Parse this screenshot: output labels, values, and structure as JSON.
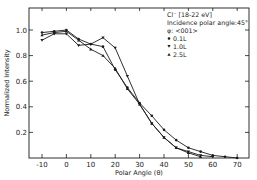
{
  "chart_data": {
    "type": "line",
    "title": "",
    "xlabel": "Polar Angle (θ)",
    "ylabel": "Normalized Intensity",
    "xlim": [
      -15,
      75
    ],
    "ylim": [
      0,
      1.15
    ],
    "x_ticks": [
      -10,
      0,
      10,
      20,
      30,
      40,
      50,
      60,
      70
    ],
    "x_tick_labels": [
      "-10",
      "0",
      "10",
      "20",
      "30",
      "40",
      "50",
      "60",
      "70"
    ],
    "y_ticks": [
      0.2,
      0.4,
      0.6,
      0.8,
      1.0
    ],
    "y_tick_labels": [
      "0.2",
      "0.4",
      "0.6",
      "0.8",
      "1.0"
    ],
    "grid": false,
    "legend_position": "upper right",
    "annotations": [
      "Cl⁻ [18-22 eV]",
      "Incidence polar angle: 45°",
      "φ: <001>"
    ],
    "series": [
      {
        "name": "0.1L",
        "marker": "circle",
        "x": [
          -10,
          -5,
          0,
          5,
          10,
          15,
          20,
          25,
          30,
          35,
          40,
          45,
          50,
          55,
          60,
          65,
          70
        ],
        "values": [
          0.98,
          0.99,
          1.0,
          0.93,
          0.89,
          0.87,
          0.69,
          0.55,
          0.43,
          0.33,
          0.22,
          0.14,
          0.08,
          0.05,
          0.02,
          0.01,
          0.0
        ]
      },
      {
        "name": "1.0L",
        "marker": "triangle-down",
        "x": [
          -10,
          -5,
          0,
          5,
          10,
          15,
          20,
          25,
          30,
          35,
          40,
          45,
          50,
          55,
          60
        ],
        "values": [
          0.92,
          0.97,
          0.97,
          0.88,
          0.89,
          0.94,
          0.86,
          0.64,
          0.42,
          0.27,
          0.16,
          0.08,
          0.05,
          0.02,
          0.01
        ]
      },
      {
        "name": "2.5L",
        "marker": "triangle-up",
        "x": [
          -10,
          -5,
          0,
          5,
          10,
          15,
          20,
          25,
          30,
          35,
          40,
          45,
          50,
          55
        ],
        "values": [
          0.96,
          0.98,
          0.99,
          0.92,
          0.85,
          0.8,
          0.7,
          0.54,
          0.42,
          0.27,
          0.16,
          0.08,
          0.04,
          0.01
        ]
      }
    ]
  },
  "legend": {
    "line1": "Cl⁻ [18-22 eV]",
    "line2": "Incidence polar angle:45°",
    "line3": "φ: <001>",
    "items": [
      "0.1L",
      "1.0L",
      "2.5L"
    ]
  },
  "axes": {
    "xlabel": "Polar Angle (θ)",
    "ylabel": "Normalized Intensity"
  },
  "style": {
    "line_color": "#1a1a1a",
    "background": "#ffffff"
  }
}
